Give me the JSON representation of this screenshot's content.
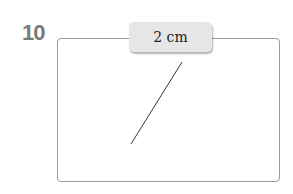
{
  "problem": {
    "number": "10",
    "measurement_label": "2 cm"
  }
}
